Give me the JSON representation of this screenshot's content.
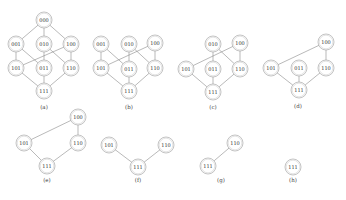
{
  "figure": {
    "panels": [
      {
        "id": "a",
        "label": "(a)",
        "label_pos": [
          44,
          109
        ],
        "nodes": [
          {
            "id": "000",
            "x": 44,
            "y": 20
          },
          {
            "id": "001",
            "x": 16,
            "y": 44
          },
          {
            "id": "010",
            "x": 44,
            "y": 44
          },
          {
            "id": "100",
            "x": 71,
            "y": 44
          },
          {
            "id": "101",
            "x": 16,
            "y": 68
          },
          {
            "id": "011",
            "x": 44,
            "y": 68
          },
          {
            "id": "110",
            "x": 71,
            "y": 68
          },
          {
            "id": "111",
            "x": 44,
            "y": 91
          }
        ],
        "edges": [
          [
            "000",
            "001"
          ],
          [
            "000",
            "010"
          ],
          [
            "000",
            "100"
          ],
          [
            "001",
            "101"
          ],
          [
            "001",
            "011"
          ],
          [
            "010",
            "011"
          ],
          [
            "010",
            "110"
          ],
          [
            "100",
            "101"
          ],
          [
            "100",
            "110"
          ],
          [
            "101",
            "111"
          ],
          [
            "011",
            "111"
          ],
          [
            "110",
            "111"
          ]
        ]
      },
      {
        "id": "b",
        "label": "(b)",
        "label_pos": [
          129,
          109
        ],
        "nodes": [
          {
            "id": "001",
            "x": 101,
            "y": 44
          },
          {
            "id": "010",
            "x": 129,
            "y": 44
          },
          {
            "id": "100",
            "x": 155,
            "y": 43
          },
          {
            "id": "101",
            "x": 101,
            "y": 68
          },
          {
            "id": "011",
            "x": 129,
            "y": 69
          },
          {
            "id": "110",
            "x": 155,
            "y": 68
          },
          {
            "id": "111",
            "x": 129,
            "y": 91
          }
        ],
        "edges": [
          [
            "001",
            "101"
          ],
          [
            "001",
            "011"
          ],
          [
            "010",
            "011"
          ],
          [
            "010",
            "110"
          ],
          [
            "100",
            "101"
          ],
          [
            "100",
            "110"
          ],
          [
            "101",
            "111"
          ],
          [
            "011",
            "111"
          ],
          [
            "110",
            "111"
          ]
        ]
      },
      {
        "id": "c",
        "label": "(c)",
        "label_pos": [
          213,
          109
        ],
        "nodes": [
          {
            "id": "010",
            "x": 213,
            "y": 44
          },
          {
            "id": "100",
            "x": 240,
            "y": 43
          },
          {
            "id": "101",
            "x": 186,
            "y": 69
          },
          {
            "id": "011",
            "x": 213,
            "y": 69
          },
          {
            "id": "110",
            "x": 240,
            "y": 69
          },
          {
            "id": "111",
            "x": 213,
            "y": 92
          }
        ],
        "edges": [
          [
            "010",
            "011"
          ],
          [
            "010",
            "110"
          ],
          [
            "100",
            "101"
          ],
          [
            "100",
            "110"
          ],
          [
            "101",
            "111"
          ],
          [
            "011",
            "111"
          ],
          [
            "110",
            "111"
          ]
        ]
      },
      {
        "id": "d",
        "label": "(d)",
        "label_pos": [
          298,
          108
        ],
        "nodes": [
          {
            "id": "100",
            "x": 326,
            "y": 42
          },
          {
            "id": "101",
            "x": 271,
            "y": 68
          },
          {
            "id": "011",
            "x": 299,
            "y": 68
          },
          {
            "id": "110",
            "x": 326,
            "y": 68
          },
          {
            "id": "111",
            "x": 299,
            "y": 90
          }
        ],
        "edges": [
          [
            "100",
            "101"
          ],
          [
            "100",
            "110"
          ],
          [
            "101",
            "111"
          ],
          [
            "011",
            "111"
          ],
          [
            "110",
            "111"
          ]
        ]
      },
      {
        "id": "e",
        "label": "(e)",
        "label_pos": [
          47,
          182
        ],
        "nodes": [
          {
            "id": "100",
            "x": 78,
            "y": 117
          },
          {
            "id": "101",
            "x": 24,
            "y": 143
          },
          {
            "id": "110",
            "x": 78,
            "y": 143
          },
          {
            "id": "111",
            "x": 47,
            "y": 166
          }
        ],
        "edges": [
          [
            "100",
            "101"
          ],
          [
            "100",
            "110"
          ],
          [
            "101",
            "111"
          ],
          [
            "110",
            "111"
          ]
        ]
      },
      {
        "id": "f",
        "label": "(f)",
        "label_pos": [
          138,
          182
        ],
        "nodes": [
          {
            "id": "101",
            "x": 109,
            "y": 145
          },
          {
            "id": "110",
            "x": 166,
            "y": 145
          },
          {
            "id": "111",
            "x": 138,
            "y": 167
          }
        ],
        "edges": [
          [
            "101",
            "111"
          ],
          [
            "110",
            "111"
          ]
        ]
      },
      {
        "id": "g",
        "label": "(g)",
        "label_pos": [
          221,
          182
        ],
        "nodes": [
          {
            "id": "110",
            "x": 235,
            "y": 143
          },
          {
            "id": "111",
            "x": 208,
            "y": 166
          }
        ],
        "edges": [
          [
            "110",
            "111"
          ]
        ]
      },
      {
        "id": "h",
        "label": "(h)",
        "label_pos": [
          293,
          182
        ],
        "nodes": [
          {
            "id": "111",
            "x": 293,
            "y": 167
          }
        ],
        "edges": []
      }
    ],
    "node_radius": 8,
    "colors": {
      "edge": "#8a8a8a",
      "node_stroke": "#9a9a9a",
      "text": "#333333",
      "background": "#ffffff"
    }
  }
}
